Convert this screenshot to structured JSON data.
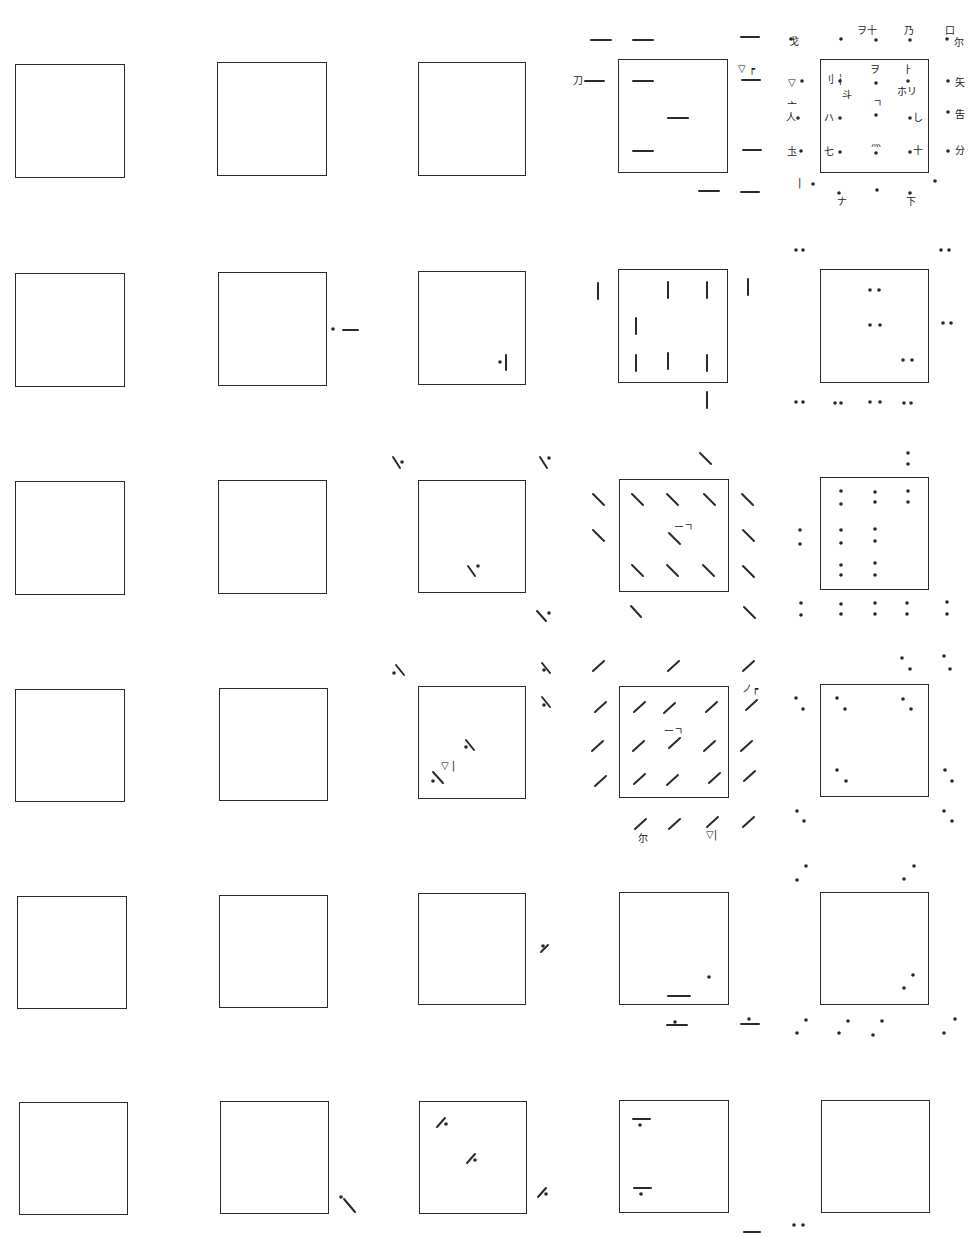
{
  "figure": {
    "layout": {
      "rows": 6,
      "cols": 5
    },
    "col_x": [
      15,
      217,
      418,
      618,
      820
    ],
    "row_y": [
      62,
      270,
      479,
      686,
      893,
      1100
    ],
    "square_size": [
      110,
      115
    ],
    "ink_color": "#2a2a2a"
  },
  "squares": [
    {
      "id": "r1c1",
      "row": 1,
      "col": 1,
      "x": 15,
      "y": 64,
      "w": 110,
      "h": 114
    },
    {
      "id": "r1c2",
      "row": 1,
      "col": 2,
      "x": 217,
      "y": 62,
      "w": 110,
      "h": 114
    },
    {
      "id": "r1c3",
      "row": 1,
      "col": 3,
      "x": 418,
      "y": 62,
      "w": 108,
      "h": 114
    },
    {
      "id": "r1c4",
      "row": 1,
      "col": 4,
      "x": 618,
      "y": 59,
      "w": 110,
      "h": 114
    },
    {
      "id": "r1c5",
      "row": 1,
      "col": 5,
      "x": 820,
      "y": 59,
      "w": 109,
      "h": 114
    },
    {
      "id": "r2c1",
      "row": 2,
      "col": 1,
      "x": 15,
      "y": 273,
      "w": 110,
      "h": 114
    },
    {
      "id": "r2c2",
      "row": 2,
      "col": 2,
      "x": 218,
      "y": 272,
      "w": 109,
      "h": 114
    },
    {
      "id": "r2c3",
      "row": 2,
      "col": 3,
      "x": 418,
      "y": 271,
      "w": 108,
      "h": 114
    },
    {
      "id": "r2c4",
      "row": 2,
      "col": 4,
      "x": 618,
      "y": 269,
      "w": 110,
      "h": 114
    },
    {
      "id": "r2c5",
      "row": 2,
      "col": 5,
      "x": 820,
      "y": 269,
      "w": 109,
      "h": 114
    },
    {
      "id": "r3c1",
      "row": 3,
      "col": 1,
      "x": 15,
      "y": 481,
      "w": 110,
      "h": 114
    },
    {
      "id": "r3c2",
      "row": 3,
      "col": 2,
      "x": 218,
      "y": 480,
      "w": 109,
      "h": 114
    },
    {
      "id": "r3c3",
      "row": 3,
      "col": 3,
      "x": 418,
      "y": 480,
      "w": 108,
      "h": 113
    },
    {
      "id": "r3c4",
      "row": 3,
      "col": 4,
      "x": 619,
      "y": 479,
      "w": 110,
      "h": 113
    },
    {
      "id": "r3c5",
      "row": 3,
      "col": 5,
      "x": 820,
      "y": 477,
      "w": 109,
      "h": 113
    },
    {
      "id": "r4c1",
      "row": 4,
      "col": 1,
      "x": 15,
      "y": 689,
      "w": 110,
      "h": 113
    },
    {
      "id": "r4c2",
      "row": 4,
      "col": 2,
      "x": 219,
      "y": 688,
      "w": 109,
      "h": 113
    },
    {
      "id": "r4c3",
      "row": 4,
      "col": 3,
      "x": 418,
      "y": 686,
      "w": 108,
      "h": 113
    },
    {
      "id": "r4c4",
      "row": 4,
      "col": 4,
      "x": 619,
      "y": 686,
      "w": 110,
      "h": 112
    },
    {
      "id": "r4c5",
      "row": 4,
      "col": 5,
      "x": 820,
      "y": 684,
      "w": 109,
      "h": 113
    },
    {
      "id": "r5c1",
      "row": 5,
      "col": 1,
      "x": 17,
      "y": 896,
      "w": 110,
      "h": 113
    },
    {
      "id": "r5c2",
      "row": 5,
      "col": 2,
      "x": 219,
      "y": 895,
      "w": 109,
      "h": 113
    },
    {
      "id": "r5c3",
      "row": 5,
      "col": 3,
      "x": 418,
      "y": 893,
      "w": 108,
      "h": 112
    },
    {
      "id": "r5c4",
      "row": 5,
      "col": 4,
      "x": 619,
      "y": 892,
      "w": 110,
      "h": 113
    },
    {
      "id": "r5c5",
      "row": 5,
      "col": 5,
      "x": 820,
      "y": 892,
      "w": 109,
      "h": 113
    },
    {
      "id": "r6c1",
      "row": 6,
      "col": 1,
      "x": 19,
      "y": 1102,
      "w": 109,
      "h": 113
    },
    {
      "id": "r6c2",
      "row": 6,
      "col": 2,
      "x": 220,
      "y": 1101,
      "w": 109,
      "h": 113
    },
    {
      "id": "r6c3",
      "row": 6,
      "col": 3,
      "x": 419,
      "y": 1101,
      "w": 108,
      "h": 113
    },
    {
      "id": "r6c4",
      "row": 6,
      "col": 4,
      "x": 619,
      "y": 1100,
      "w": 110,
      "h": 113
    },
    {
      "id": "r6c5",
      "row": 6,
      "col": 5,
      "x": 821,
      "y": 1100,
      "w": 109,
      "h": 113
    }
  ],
  "marks": {
    "hbars": [
      [
        591,
        40,
        611,
        40
      ],
      [
        633,
        40,
        653,
        40
      ],
      [
        741,
        37,
        759,
        37
      ],
      [
        585,
        81,
        604,
        81
      ],
      [
        633,
        81,
        653,
        81
      ],
      [
        742,
        80,
        760,
        80
      ],
      [
        668,
        118,
        688,
        118
      ],
      [
        633,
        151,
        653,
        151
      ],
      [
        743,
        150,
        761,
        150
      ],
      [
        699,
        191,
        719,
        191
      ],
      [
        741,
        192,
        759,
        192
      ],
      [
        343,
        330,
        358,
        330
      ],
      [
        668,
        996,
        690,
        996
      ],
      [
        667,
        1025,
        687,
        1025
      ],
      [
        741,
        1024,
        759,
        1024
      ],
      [
        633,
        1119,
        650,
        1119
      ],
      [
        634,
        1188,
        651,
        1188
      ],
      [
        744,
        1232,
        760,
        1232
      ]
    ],
    "vbars": [
      [
        598,
        283,
        598,
        299
      ],
      [
        668,
        282,
        668,
        298
      ],
      [
        707,
        282,
        707,
        298
      ],
      [
        748,
        279,
        748,
        295
      ],
      [
        636,
        318,
        636,
        334
      ],
      [
        636,
        355,
        636,
        371
      ],
      [
        668,
        353,
        668,
        369
      ],
      [
        707,
        355,
        707,
        371
      ],
      [
        707,
        392,
        707,
        408
      ],
      [
        506,
        355,
        506,
        370
      ]
    ],
    "backslash": [
      [
        393,
        457,
        400,
        468
      ],
      [
        540,
        457,
        547,
        468
      ],
      [
        468,
        566,
        475,
        576
      ],
      [
        537,
        611,
        546,
        621
      ],
      [
        700,
        453,
        711,
        464
      ],
      [
        593,
        494,
        604,
        505
      ],
      [
        632,
        494,
        643,
        505
      ],
      [
        667,
        494,
        678,
        505
      ],
      [
        704,
        494,
        715,
        505
      ],
      [
        742,
        494,
        753,
        505
      ],
      [
        593,
        530,
        604,
        541
      ],
      [
        669,
        533,
        680,
        544
      ],
      [
        743,
        530,
        754,
        541
      ],
      [
        632,
        565,
        643,
        576
      ],
      [
        667,
        565,
        678,
        576
      ],
      [
        703,
        565,
        714,
        576
      ],
      [
        743,
        566,
        754,
        577
      ],
      [
        631,
        606,
        641,
        617
      ],
      [
        744,
        607,
        755,
        618
      ],
      [
        396,
        665,
        404,
        675
      ],
      [
        542,
        663,
        550,
        673
      ],
      [
        542,
        697,
        550,
        707
      ],
      [
        466,
        740,
        474,
        750
      ],
      [
        433,
        772,
        443,
        783
      ],
      [
        344,
        1199,
        355,
        1212
      ]
    ],
    "slash": [
      [
        593,
        671,
        604,
        661
      ],
      [
        668,
        671,
        679,
        661
      ],
      [
        743,
        671,
        754,
        661
      ],
      [
        595,
        712,
        606,
        702
      ],
      [
        634,
        712,
        645,
        702
      ],
      [
        664,
        713,
        675,
        703
      ],
      [
        706,
        712,
        717,
        702
      ],
      [
        746,
        710,
        757,
        700
      ],
      [
        592,
        751,
        603,
        741
      ],
      [
        633,
        751,
        644,
        741
      ],
      [
        669,
        748,
        680,
        738
      ],
      [
        704,
        751,
        715,
        741
      ],
      [
        741,
        751,
        752,
        741
      ],
      [
        595,
        786,
        606,
        776
      ],
      [
        634,
        784,
        645,
        774
      ],
      [
        667,
        785,
        678,
        775
      ],
      [
        709,
        783,
        720,
        773
      ],
      [
        744,
        781,
        755,
        771
      ],
      [
        635,
        829,
        646,
        819
      ],
      [
        669,
        829,
        680,
        819
      ],
      [
        707,
        827,
        718,
        817
      ],
      [
        743,
        827,
        754,
        817
      ],
      [
        541,
        952,
        548,
        945
      ],
      [
        437,
        1127,
        445,
        1118
      ],
      [
        467,
        1163,
        475,
        1154
      ],
      [
        538,
        1197,
        546,
        1188
      ]
    ],
    "dots": [
      [
        791,
        39
      ],
      [
        841,
        39
      ],
      [
        876,
        40
      ],
      [
        910,
        40
      ],
      [
        947,
        39
      ],
      [
        802,
        81
      ],
      [
        840,
        81
      ],
      [
        876,
        83
      ],
      [
        908,
        81
      ],
      [
        948,
        81
      ],
      [
        798,
        118
      ],
      [
        840,
        118
      ],
      [
        876,
        115
      ],
      [
        910,
        118
      ],
      [
        948,
        112
      ],
      [
        801,
        151
      ],
      [
        840,
        152
      ],
      [
        876,
        153
      ],
      [
        910,
        152
      ],
      [
        948,
        151
      ],
      [
        813,
        184
      ],
      [
        935,
        181
      ],
      [
        839,
        193
      ],
      [
        877,
        190
      ],
      [
        910,
        193
      ],
      [
        796,
        250
      ],
      [
        803,
        250
      ],
      [
        941,
        250
      ],
      [
        949,
        250
      ],
      [
        870,
        290
      ],
      [
        879,
        290
      ],
      [
        870,
        325
      ],
      [
        880,
        325
      ],
      [
        943,
        323
      ],
      [
        951,
        323
      ],
      [
        903,
        360
      ],
      [
        912,
        360
      ],
      [
        796,
        402
      ],
      [
        803,
        402
      ],
      [
        835,
        403
      ],
      [
        841,
        403
      ],
      [
        870,
        402
      ],
      [
        880,
        402
      ],
      [
        904,
        403
      ],
      [
        911,
        403
      ],
      [
        333,
        329
      ],
      [
        500,
        362
      ],
      [
        908,
        453
      ],
      [
        908,
        464
      ],
      [
        841,
        491
      ],
      [
        841,
        504
      ],
      [
        875,
        492
      ],
      [
        875,
        502
      ],
      [
        908,
        491
      ],
      [
        908,
        502
      ],
      [
        800,
        530
      ],
      [
        800,
        544
      ],
      [
        841,
        530
      ],
      [
        841,
        543
      ],
      [
        875,
        529
      ],
      [
        875,
        541
      ],
      [
        841,
        565
      ],
      [
        841,
        575
      ],
      [
        875,
        563
      ],
      [
        875,
        575
      ],
      [
        801,
        603
      ],
      [
        801,
        615
      ],
      [
        841,
        604
      ],
      [
        841,
        614
      ],
      [
        875,
        603
      ],
      [
        875,
        614
      ],
      [
        907,
        603
      ],
      [
        907,
        614
      ],
      [
        947,
        602
      ],
      [
        947,
        614
      ],
      [
        402,
        462
      ],
      [
        549,
        458
      ],
      [
        478,
        566
      ],
      [
        549,
        613
      ],
      [
        902,
        658
      ],
      [
        910,
        669
      ],
      [
        944,
        656
      ],
      [
        950,
        669
      ],
      [
        796,
        698
      ],
      [
        803,
        709
      ],
      [
        837,
        698
      ],
      [
        845,
        709
      ],
      [
        903,
        699
      ],
      [
        911,
        709
      ],
      [
        837,
        770
      ],
      [
        846,
        781
      ],
      [
        945,
        770
      ],
      [
        952,
        781
      ],
      [
        797,
        811
      ],
      [
        804,
        821
      ],
      [
        944,
        811
      ],
      [
        952,
        821
      ],
      [
        394,
        673
      ],
      [
        544,
        670
      ],
      [
        544,
        705
      ],
      [
        466,
        747
      ],
      [
        433,
        781
      ],
      [
        806,
        866
      ],
      [
        797,
        880
      ],
      [
        914,
        866
      ],
      [
        904,
        879
      ],
      [
        913,
        975
      ],
      [
        904,
        988
      ],
      [
        806,
        1020
      ],
      [
        797,
        1033
      ],
      [
        848,
        1021
      ],
      [
        839,
        1033
      ],
      [
        882,
        1021
      ],
      [
        873,
        1035
      ],
      [
        955,
        1019
      ],
      [
        944,
        1033
      ],
      [
        709,
        977
      ],
      [
        675,
        1022
      ],
      [
        749,
        1019
      ],
      [
        543,
        946
      ],
      [
        446,
        1124
      ],
      [
        475,
        1160
      ],
      [
        546,
        1194
      ],
      [
        640,
        1125
      ],
      [
        641,
        1194
      ],
      [
        341,
        1197
      ],
      [
        794,
        1225
      ],
      [
        803,
        1225
      ]
    ],
    "labels": [
      {
        "x": 789,
        "y": 37,
        "text": "戈"
      },
      {
        "x": 857,
        "y": 26,
        "text": "ヲ十"
      },
      {
        "x": 904,
        "y": 26,
        "text": "乃"
      },
      {
        "x": 945,
        "y": 26,
        "text": "口"
      },
      {
        "x": 954,
        "y": 38,
        "text": "尔"
      },
      {
        "x": 573,
        "y": 76,
        "text": "刀"
      },
      {
        "x": 738,
        "y": 64,
        "text": "▽ ┍"
      },
      {
        "x": 788,
        "y": 78,
        "text": "▽"
      },
      {
        "x": 824,
        "y": 75,
        "text": "刂 ┆"
      },
      {
        "x": 870,
        "y": 65,
        "text": "ヲ"
      },
      {
        "x": 903,
        "y": 65,
        "text": "ㅏ"
      },
      {
        "x": 842,
        "y": 90,
        "text": "斗"
      },
      {
        "x": 897,
        "y": 87,
        "text": "ホリ"
      },
      {
        "x": 955,
        "y": 78,
        "text": "矢"
      },
      {
        "x": 873,
        "y": 99,
        "text": "ㄱ"
      },
      {
        "x": 787,
        "y": 102,
        "text": "亠"
      },
      {
        "x": 786,
        "y": 113,
        "text": "人"
      },
      {
        "x": 824,
        "y": 113,
        "text": "ハ"
      },
      {
        "x": 913,
        "y": 113,
        "text": "し"
      },
      {
        "x": 955,
        "y": 110,
        "text": "吿"
      },
      {
        "x": 871,
        "y": 138,
        "text": "灬"
      },
      {
        "x": 787,
        "y": 147,
        "text": "圡"
      },
      {
        "x": 824,
        "y": 147,
        "text": "七"
      },
      {
        "x": 913,
        "y": 146,
        "text": "十"
      },
      {
        "x": 955,
        "y": 146,
        "text": "分"
      },
      {
        "x": 798,
        "y": 178,
        "text": "|"
      },
      {
        "x": 837,
        "y": 197,
        "text": "ナ"
      },
      {
        "x": 906,
        "y": 197,
        "text": "下"
      },
      {
        "x": 674,
        "y": 523,
        "text": "ーㄱ"
      },
      {
        "x": 742,
        "y": 684,
        "text": "ノ┍"
      },
      {
        "x": 664,
        "y": 727,
        "text": "ーㄱ"
      },
      {
        "x": 638,
        "y": 834,
        "text": "尔"
      },
      {
        "x": 706,
        "y": 830,
        "text": "▽|"
      },
      {
        "x": 441,
        "y": 761,
        "text": "▽ |"
      }
    ]
  }
}
